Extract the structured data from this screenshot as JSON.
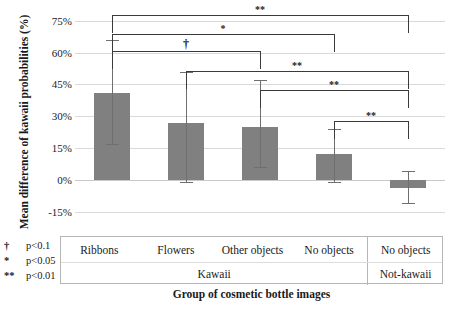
{
  "chart_data": {
    "type": "bar",
    "title": "",
    "xlabel": "Group of cosmetic bottle images",
    "ylabel": "Mean difference of kawaii probabilities (%)",
    "categories": [
      "Ribbons",
      "Flowers",
      "Other objects",
      "No objects",
      "No objects"
    ],
    "group_labels": [
      "Kawaii",
      "Not-kawaii"
    ],
    "values": [
      41,
      27,
      25,
      12,
      -4
    ],
    "err_upper": [
      66,
      51,
      47,
      24,
      4
    ],
    "err_lower": [
      17,
      -1,
      6,
      -1,
      -11
    ],
    "ylim": [
      -18,
      82
    ],
    "ytick_values": [
      75,
      60,
      45,
      30,
      15,
      0,
      -15
    ],
    "ytick_labels": [
      "75%",
      "60%",
      "45%",
      "30%",
      "15%",
      "0%",
      "-15%"
    ],
    "grid": true,
    "legend_position": "bottom-left",
    "bar_color": "#808080",
    "annotations": [
      {
        "from": 0,
        "to": 4,
        "label": "**",
        "level": 15
      },
      {
        "from": 0,
        "to": 3,
        "label": "*",
        "level": 34
      },
      {
        "from": 0,
        "to": 2,
        "label": "†",
        "level": 51
      },
      {
        "from": 1,
        "to": 4,
        "label": "**",
        "level": 71
      },
      {
        "from": 2,
        "to": 4,
        "label": "**",
        "level": 90
      },
      {
        "from": 3,
        "to": 4,
        "label": "**",
        "level": 121
      }
    ]
  },
  "legend": {
    "items": [
      {
        "symbol": "†",
        "text": "p<0.1"
      },
      {
        "symbol": "*",
        "text": "p<0.05"
      },
      {
        "symbol": "**",
        "text": "p<0.01"
      }
    ]
  },
  "xaxis_table": {
    "row1": [
      "Ribbons",
      "Flowers",
      "Other objects",
      "No objects",
      "No objects"
    ],
    "row2": [
      "Kawaii",
      "Not-kawaii"
    ]
  }
}
